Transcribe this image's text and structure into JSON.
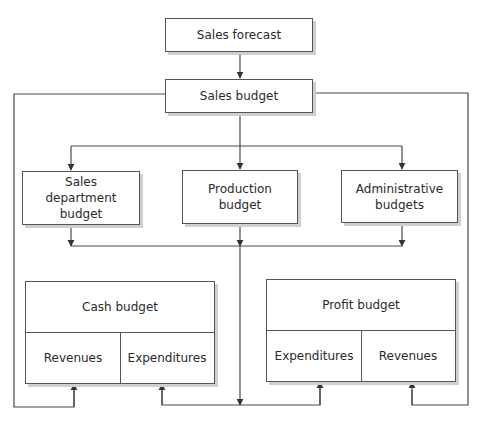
{
  "diagram": {
    "type": "flowchart",
    "nodes": {
      "sales_forecast": {
        "label": "Sales forecast"
      },
      "sales_budget": {
        "label": "Sales budget"
      },
      "sales_department_budget": {
        "line1": "Sales",
        "line2": "department budget"
      },
      "production_budget": {
        "line1": "Production",
        "line2": "budget"
      },
      "administrative_budgets": {
        "line1": "Administrative",
        "line2": "budgets"
      },
      "cash_budget": {
        "title": "Cash budget",
        "left_cell": "Revenues",
        "right_cell": "Expenditures"
      },
      "profit_budget": {
        "title": "Profit budget",
        "left_cell": "Expenditures",
        "right_cell": "Revenues"
      }
    },
    "edges": [
      {
        "from": "Sales forecast",
        "to": "Sales budget"
      },
      {
        "from": "Sales budget",
        "to": "Sales department budget"
      },
      {
        "from": "Sales budget",
        "to": "Production budget"
      },
      {
        "from": "Sales budget",
        "to": "Administrative budgets"
      },
      {
        "from": "Sales budget",
        "to": "Cash budget / Revenues"
      },
      {
        "from": "Sales budget",
        "to": "Profit budget / Revenues"
      },
      {
        "from": "Sales department budget",
        "to": "Cash budget / Expenditures"
      },
      {
        "from": "Production budget",
        "to": "Cash budget / Expenditures"
      },
      {
        "from": "Administrative budgets",
        "to": "Cash budget / Expenditures"
      },
      {
        "from": "Sales department budget",
        "to": "Profit budget / Expenditures"
      },
      {
        "from": "Production budget",
        "to": "Profit budget / Expenditures"
      },
      {
        "from": "Administrative budgets",
        "to": "Profit budget / Expenditures"
      }
    ],
    "colors": {
      "line": "#4a4a4a",
      "box_border": "#555555",
      "shadow": "#cfcfcf",
      "background": "#ffffff"
    }
  }
}
